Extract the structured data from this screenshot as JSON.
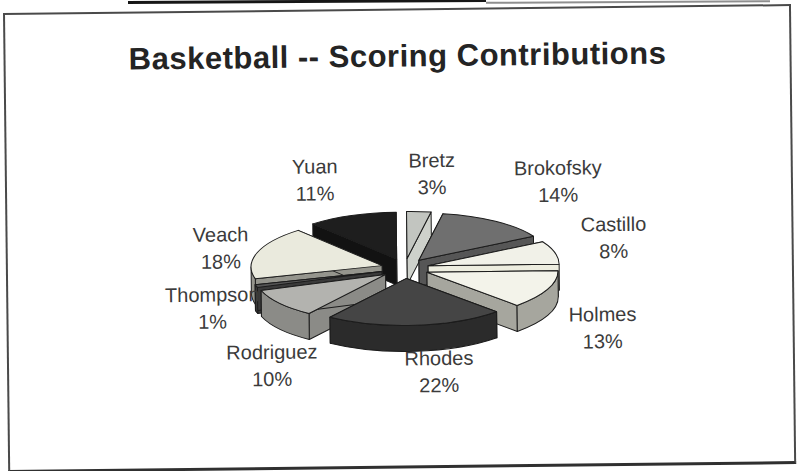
{
  "chart_data": {
    "type": "pie",
    "style": "3d-exploded",
    "title": "Basketball -- Scoring Contributions",
    "unit": "percent",
    "start_angle_deg": 0,
    "direction": "clockwise",
    "legend": "none",
    "slices": [
      {
        "name": "Bretz",
        "value": 3,
        "pct_label": "3%",
        "top_color": "#c2c5c0",
        "side_color": "#ced1cb",
        "label_x": 425,
        "label_y": 164
      },
      {
        "name": "Brokofsky",
        "value": 14,
        "pct_label": "14%",
        "top_color": "#6f6f6f",
        "side_color": "#565656",
        "label_x": 551,
        "label_y": 173
      },
      {
        "name": "Castillo",
        "value": 8,
        "pct_label": "8%",
        "top_color": "#f1f1e8",
        "side_color": "#ededdf",
        "label_x": 606,
        "label_y": 230
      },
      {
        "name": "Holmes",
        "value": 13,
        "pct_label": "13%",
        "top_color": "#f3f3ea",
        "side_color": "#a6a69e",
        "label_x": 594,
        "label_y": 320
      },
      {
        "name": "Rhodes",
        "value": 22,
        "pct_label": "22%",
        "top_color": "#454545",
        "side_color": "#2b2b2b",
        "label_x": 430,
        "label_y": 362
      },
      {
        "name": "Rodriguez",
        "value": 10,
        "pct_label": "10%",
        "top_color": "#b3b3af",
        "side_color": "#8b8b87",
        "label_x": 263,
        "label_y": 354
      },
      {
        "name": "Thompson",
        "value": 1,
        "pct_label": "1%",
        "top_color": "#555555",
        "side_color": "#3a3a3a",
        "label_x": 204,
        "label_y": 296
      },
      {
        "name": "Veach",
        "value": 18,
        "pct_label": "18%",
        "top_color": "#eaeadd",
        "side_color": "#95958d",
        "label_x": 213,
        "label_y": 236
      },
      {
        "name": "Yuan",
        "value": 11,
        "pct_label": "11%",
        "top_color": "#1e1e1e",
        "side_color": "#121212",
        "label_x": 308,
        "label_y": 169
      }
    ]
  }
}
